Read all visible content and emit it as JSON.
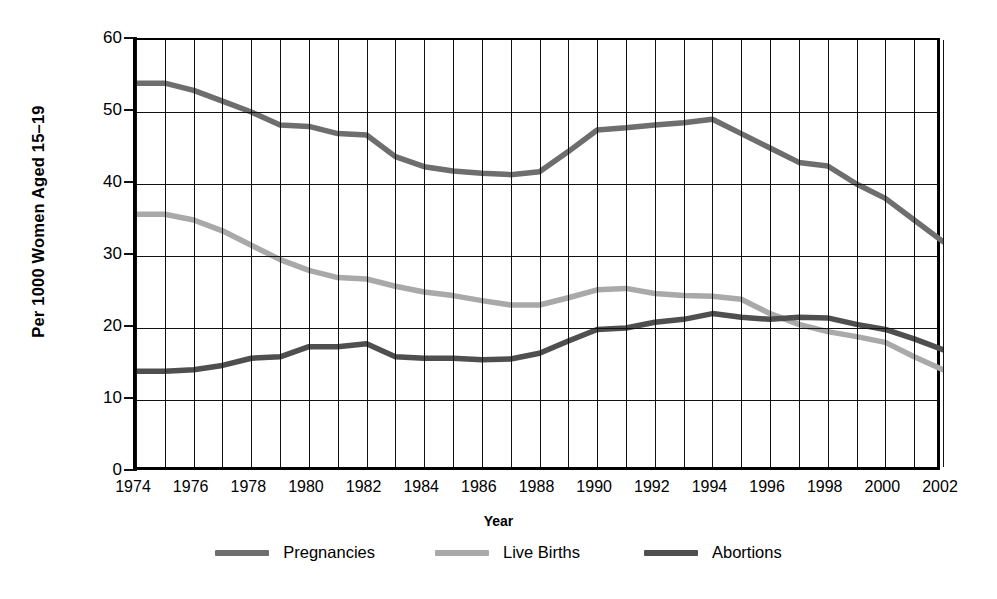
{
  "chart_data": {
    "type": "line",
    "title": "",
    "xlabel": "Year",
    "ylabel": "Per 1000 Women Aged 15–19",
    "xlim": [
      1974,
      2002
    ],
    "ylim": [
      0,
      60
    ],
    "yticks": [
      0,
      10,
      20,
      30,
      40,
      50,
      60
    ],
    "xticks": [
      1974,
      1976,
      1978,
      1980,
      1982,
      1984,
      1986,
      1988,
      1990,
      1992,
      1994,
      1996,
      1998,
      2000,
      2002
    ],
    "grid": "vertical gridlines every year; horizontal gridlines at every 10 units",
    "legend_position": "below plot, horizontal",
    "x": [
      1974,
      1975,
      1976,
      1977,
      1978,
      1979,
      1980,
      1981,
      1982,
      1983,
      1984,
      1985,
      1986,
      1987,
      1988,
      1989,
      1990,
      1991,
      1992,
      1993,
      1994,
      1995,
      1996,
      1997,
      1998,
      1999,
      2000,
      2001,
      2002
    ],
    "series": [
      {
        "name": "Pregnancies",
        "color": "#6e6e6e",
        "values": [
          54.0,
          54.0,
          53.0,
          51.5,
          50.0,
          48.2,
          48.0,
          47.0,
          46.8,
          43.8,
          42.4,
          41.8,
          41.5,
          41.3,
          41.7,
          44.5,
          47.5,
          47.8,
          48.2,
          48.5,
          49.0,
          47.0,
          45.0,
          43.0,
          42.5,
          40.0,
          38.0,
          35.0,
          32.0
        ]
      },
      {
        "name": "Live Births",
        "color": "#a9a9a9",
        "values": [
          35.8,
          35.8,
          35.0,
          33.5,
          31.5,
          29.5,
          28.0,
          27.0,
          26.8,
          25.8,
          25.0,
          24.5,
          23.8,
          23.2,
          23.2,
          24.2,
          25.3,
          25.5,
          24.8,
          24.5,
          24.4,
          24.0,
          22.0,
          20.5,
          19.5,
          18.8,
          18.0,
          16.0,
          14.2
        ]
      },
      {
        "name": "Abortions",
        "color": "#4f4f4f",
        "values": [
          14.0,
          14.0,
          14.2,
          14.8,
          15.8,
          16.0,
          17.4,
          17.4,
          17.8,
          16.0,
          15.8,
          15.8,
          15.6,
          15.7,
          16.5,
          18.2,
          19.8,
          20.0,
          20.8,
          21.2,
          22.0,
          21.5,
          21.2,
          21.5,
          21.4,
          20.5,
          19.8,
          18.5,
          17.0
        ]
      }
    ]
  },
  "axes": {
    "ylabel": "Per 1000 Women Aged 15–19",
    "xlabel": "Year",
    "ytick_labels": [
      "60",
      "50",
      "40",
      "30",
      "20",
      "10",
      "0"
    ],
    "xtick_labels": [
      "1974",
      "1976",
      "1978",
      "1980",
      "1982",
      "1984",
      "1986",
      "1988",
      "1990",
      "1992",
      "1994",
      "1996",
      "1998",
      "2000",
      "2002"
    ]
  },
  "legend": {
    "items": [
      {
        "label": "Pregnancies",
        "color": "#6e6e6e"
      },
      {
        "label": "Live Births",
        "color": "#a9a9a9"
      },
      {
        "label": "Abortions",
        "color": "#4f4f4f"
      }
    ]
  }
}
